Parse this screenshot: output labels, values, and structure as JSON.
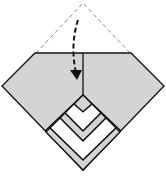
{
  "diagram": {
    "type": "origami-fold-step",
    "colors": {
      "paper": "#d4d4d4",
      "line": "#111111",
      "white": "#ffffff",
      "dashed": "#888888"
    },
    "elements": [
      "dashed-triangle-flap",
      "fold-arrow",
      "folded-gray-body",
      "nested-chevrons"
    ]
  }
}
